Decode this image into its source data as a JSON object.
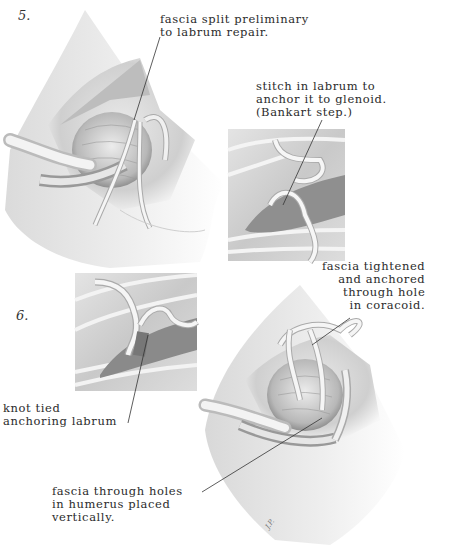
{
  "figure": {
    "steps": [
      {
        "number": "5.",
        "annotations": [
          {
            "id": "fascia-split",
            "text": "fascia split preliminary\nto labrum repair."
          },
          {
            "id": "stitch-labrum",
            "text": "stitch in labrum to\nanchor it to glenoid.\n(Bankart step.)"
          }
        ]
      },
      {
        "number": "6.",
        "annotations": [
          {
            "id": "fascia-tightened",
            "text": "fascia tightened\nand anchored\nthrough hole\nin coracoid."
          },
          {
            "id": "knot-tied",
            "text": "knot tied\nanchoring labrum"
          },
          {
            "id": "fascia-holes-humerus",
            "text": "fascia through holes\nin humerus placed\nvertically."
          }
        ]
      }
    ],
    "signature": "J.P."
  }
}
